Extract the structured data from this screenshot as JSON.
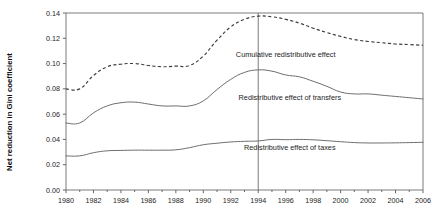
{
  "chart_data": {
    "type": "line",
    "title": "",
    "xlabel": "",
    "ylabel": "Net reduction in Gini coefficient",
    "xlim": [
      1980,
      2006
    ],
    "ylim": [
      0.0,
      0.14
    ],
    "grid": false,
    "legend_position": "inline-annotation",
    "x": [
      1980,
      1981,
      1982,
      1983,
      1984,
      1985,
      1986,
      1987,
      1988,
      1989,
      1990,
      1991,
      1992,
      1993,
      1994,
      1995,
      1996,
      1997,
      1998,
      1999,
      2000,
      2001,
      2002,
      2003,
      2004,
      2005,
      2006
    ],
    "series": [
      {
        "name": "Cumulative redistributive effect",
        "style": "dashed",
        "values": [
          0.08,
          0.08,
          0.0905,
          0.0975,
          0.0995,
          0.1,
          0.0985,
          0.0975,
          0.098,
          0.0985,
          0.106,
          0.1185,
          0.129,
          0.135,
          0.1375,
          0.137,
          0.135,
          0.132,
          0.128,
          0.1245,
          0.1215,
          0.119,
          0.1175,
          0.1165,
          0.1155,
          0.115,
          0.1145
        ]
      },
      {
        "name": "Redistributive effect of transfers",
        "style": "solid",
        "values": [
          0.053,
          0.053,
          0.061,
          0.0665,
          0.069,
          0.0695,
          0.068,
          0.0665,
          0.0665,
          0.0665,
          0.0705,
          0.0795,
          0.0875,
          0.093,
          0.095,
          0.094,
          0.091,
          0.0895,
          0.086,
          0.082,
          0.0775,
          0.076,
          0.076,
          0.075,
          0.074,
          0.073,
          0.072
        ]
      },
      {
        "name": "Redistributive effect of taxes",
        "style": "solid",
        "values": [
          0.027,
          0.027,
          0.0295,
          0.031,
          0.0313,
          0.0315,
          0.0315,
          0.0315,
          0.0318,
          0.0335,
          0.0358,
          0.037,
          0.038,
          0.0385,
          0.0388,
          0.04,
          0.0398,
          0.04,
          0.0397,
          0.039,
          0.0382,
          0.0375,
          0.0372,
          0.0372,
          0.0373,
          0.0375,
          0.0377
        ]
      }
    ],
    "yticks": [
      "0.00",
      "0.02",
      "0.04",
      "0.06",
      "0.08",
      "0.10",
      "0.12",
      "0.14"
    ],
    "ytick_values": [
      0.0,
      0.02,
      0.04,
      0.06,
      0.08,
      0.1,
      0.12,
      0.14
    ],
    "xticks": [
      "1980",
      "1982",
      "1984",
      "1986",
      "1988",
      "1990",
      "1992",
      "1994",
      "1996",
      "1998",
      "2000",
      "2002",
      "2004",
      "2006"
    ],
    "xtick_values": [
      1980,
      1982,
      1984,
      1986,
      1988,
      1990,
      1992,
      1994,
      1996,
      1998,
      2000,
      2002,
      2004,
      2006
    ],
    "reference_line": {
      "x": 1994,
      "label": ""
    },
    "annotations": [
      {
        "text": "Cumulative redistributive effect",
        "x": 1996.0,
        "y": 0.1055
      },
      {
        "text": "Redistributive effect of transfers",
        "x": 1996.3,
        "y": 0.0715
      },
      {
        "text": "Redistributive effect of taxes",
        "x": 1996.3,
        "y": 0.0315
      }
    ],
    "colors": {
      "cumulative": "#3d3d3d",
      "transfers": "#6e6e6e",
      "taxes": "#6e6e6e",
      "axis": "#595959",
      "background": "#ffffff"
    }
  }
}
